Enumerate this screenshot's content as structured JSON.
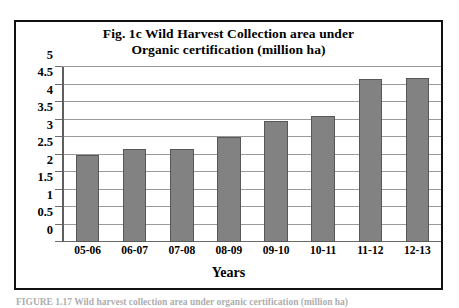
{
  "figure": {
    "frame_color": "#111111",
    "background": "#ffffff",
    "caption": "FIGURE 1.17   Wild harvest collection area under organic certification (million ha)"
  },
  "chart_data": {
    "type": "bar",
    "title": "Fig. 1c Wild Harvest Collection area under Organic certification (million ha)",
    "title_lines": [
      "Fig. 1c Wild Harvest Collection area under",
      "Organic certification (million ha)"
    ],
    "xlabel": "Years",
    "ylabel": "",
    "categories": [
      "05-06",
      "06-07",
      "07-08",
      "08-09",
      "09-10",
      "10-11",
      "11-12",
      "12-13"
    ],
    "values": [
      2.5,
      2.65,
      2.65,
      3.0,
      3.45,
      3.6,
      4.65,
      4.68
    ],
    "ylim": [
      0,
      5
    ],
    "ytick_step": 0.5,
    "ytick_labels": [
      "5",
      "4.5",
      "4",
      "3.5",
      "3",
      "2.5",
      "2",
      "1.5",
      "1",
      "0.5",
      "0"
    ],
    "ytick_values": [
      5,
      4.5,
      4,
      3.5,
      3,
      2.5,
      2,
      1.5,
      1,
      0.5,
      0
    ],
    "grid": true,
    "grid_color": "#9a9a9a",
    "legend": null,
    "legend_position": "none",
    "bar_color": "#828282",
    "bar_border_color": "#575757"
  }
}
